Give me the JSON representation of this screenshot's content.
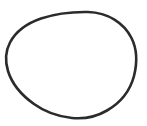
{
  "canvas": {
    "width": 147,
    "height": 126,
    "background_color": "#ffffff",
    "label": "line-drawing-canvas"
  },
  "figure": {
    "name": "oval-outline",
    "stroke_color": "#2b2b2b",
    "fill_color": "none",
    "stroke_width": 2.6,
    "bounds": {
      "left": 6,
      "top": 12,
      "right": 136,
      "bottom": 118,
      "width": 130,
      "height": 106
    },
    "extreme_points": {
      "topmost": [
        88,
        12
      ],
      "rightmost": [
        136,
        66
      ],
      "bottommost": [
        80,
        118
      ],
      "leftmost": [
        6,
        64
      ]
    },
    "path": "M 88 12 C 108 12.5 124 23 131.5 38 C 137.5 50 137 64 134 76 C 130 91 120 103 107 110.5 C 96 117 83 119 72 118 C 58 116.5 45 112 34 104 C 22 95.5 12 84 8 71 C 5 61 5.5 51 10 42.5 C 16 31 28 23 41 18.5 C 56 13.5 73 11.7 88 12 Z"
  }
}
